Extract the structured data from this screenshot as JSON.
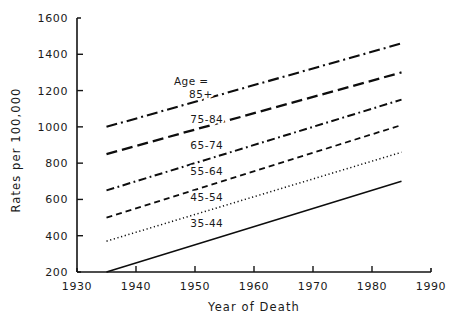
{
  "chart_data": {
    "type": "line",
    "title": "",
    "xlabel": "Year of Death",
    "ylabel": "Rates per 100,000",
    "xlim": [
      1930,
      1990
    ],
    "ylim": [
      200,
      1600
    ],
    "xticks": [
      1930,
      1940,
      1950,
      1960,
      1970,
      1980,
      1990
    ],
    "xtick_labels": [
      "1930",
      "1940",
      "1950",
      "1960",
      "1970",
      "1980",
      "1990"
    ],
    "yticks": [
      200,
      400,
      600,
      800,
      1000,
      1200,
      1400,
      1600
    ],
    "ytick_labels": [
      "200",
      "400",
      "600",
      "800",
      "1000",
      "1200",
      "1400",
      "1600"
    ],
    "grid": false,
    "legend_position": "inline-annotations",
    "legend_title": "Age =",
    "x": [
      1935,
      1985
    ],
    "series": [
      {
        "name": "85+",
        "values": [
          1000,
          1460
        ],
        "dash": "dash-dot",
        "label_x": 1951,
        "label_y": 1160
      },
      {
        "name": "75-84",
        "values": [
          850,
          1300
        ],
        "dash": "long-dash",
        "label_x": 1952,
        "label_y": 1020
      },
      {
        "name": "65-74",
        "values": [
          650,
          1150
        ],
        "dash": "dash-dot-fine",
        "label_x": 1952,
        "label_y": 880
      },
      {
        "name": "55-64",
        "values": [
          500,
          1010
        ],
        "dash": "medium-dash",
        "label_x": 1952,
        "label_y": 735
      },
      {
        "name": "45-54",
        "values": [
          370,
          860
        ],
        "dash": "dotted",
        "label_x": 1952,
        "label_y": 590
      },
      {
        "name": "35-44",
        "values": [
          200,
          700
        ],
        "dash": "solid",
        "label_x": 1952,
        "label_y": 450
      }
    ]
  },
  "axes": {
    "y_axis_title": "Rates per 100,000",
    "x_axis_title": "Year of Death"
  },
  "legend": {
    "header": "Age ="
  },
  "colors": {
    "ink": "#0d0d0d",
    "background": "#ffffff"
  }
}
